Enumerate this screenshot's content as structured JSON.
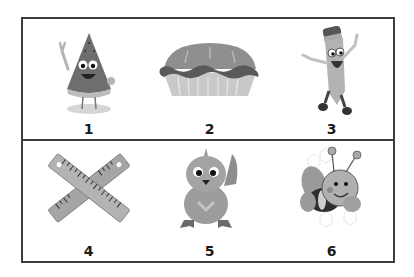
{
  "worksheet": {
    "rows": [
      {
        "items": [
          {
            "number": "1",
            "picture": "watermelon-slice"
          },
          {
            "number": "2",
            "picture": "pie"
          },
          {
            "number": "3",
            "picture": "pencil-character"
          }
        ]
      },
      {
        "items": [
          {
            "number": "4",
            "picture": "crossed-rulers"
          },
          {
            "number": "5",
            "picture": "chick"
          },
          {
            "number": "6",
            "picture": "bee"
          }
        ]
      }
    ]
  },
  "colors": {
    "border": "#3c3c3c",
    "text": "#1a1a1a",
    "dark_gray": "#6b6b6b",
    "mid_gray": "#9a9a9a",
    "light_gray": "#c8c8c8"
  }
}
